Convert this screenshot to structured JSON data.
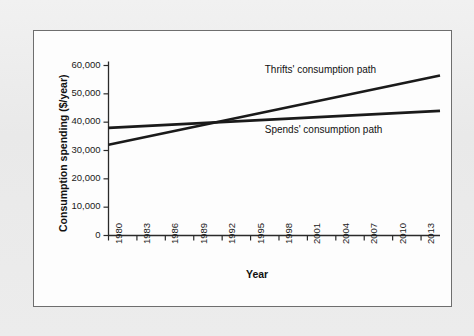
{
  "figure": {
    "frame_color": "#6e6e6e",
    "background_color": "#ededed",
    "plot_background": "#fdfdfd",
    "line_color": "#1a1a1a"
  },
  "chart_data": {
    "type": "line",
    "title": "",
    "xlabel": "Year",
    "ylabel": "Consumption spending ($/year)",
    "xlim": [
      1980,
      2015
    ],
    "ylim": [
      0,
      60000
    ],
    "grid": false,
    "legend_position": "inline-annotation",
    "x_tick_labels": [
      "1980",
      "1983",
      "1986",
      "1989",
      "1992",
      "1995",
      "1998",
      "2001",
      "2004",
      "2007",
      "2010",
      "2013"
    ],
    "x_tick_values": [
      1980,
      1983,
      1986,
      1989,
      1992,
      1995,
      1998,
      2001,
      2004,
      2007,
      2010,
      2013
    ],
    "y_tick_labels": [
      "0",
      "10,000",
      "20,000",
      "30,000",
      "40,000",
      "50,000",
      "60,000"
    ],
    "y_tick_values": [
      0,
      10000,
      20000,
      30000,
      40000,
      50000,
      60000
    ],
    "series": [
      {
        "name": "Thrifts' consumption path",
        "x": [
          1980,
          2015
        ],
        "values": [
          32000,
          56500
        ],
        "annotation": "Thrifts' consumption path"
      },
      {
        "name": "Spends' consumption path",
        "x": [
          1980,
          2015
        ],
        "values": [
          38000,
          44000
        ],
        "annotation": "Spends' consumption path"
      }
    ],
    "annotations": [
      {
        "text": "Thrifts' consumption path",
        "x": 1996.5,
        "y": 58500
      },
      {
        "text": "Spends' consumption path",
        "x": 1996.5,
        "y": 37200
      }
    ],
    "crossing_point": {
      "x": 1995,
      "y": 40500
    }
  }
}
